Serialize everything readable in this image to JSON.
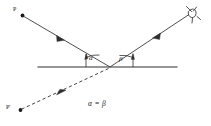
{
  "figure": {
    "type": "optics-reflection-diagram",
    "background_color": "#ffffff",
    "stroke_color": "#2a2a2a",
    "labels": {
      "source_point": "P",
      "virtual_image_point": "P'",
      "angle_of_incidence": "α",
      "angle_of_reflection": "β",
      "equation": "α = β"
    },
    "elements": {
      "mirror_line_name": "mirror-surface",
      "incident_ray_name": "incident-ray",
      "reflected_ray_name": "reflected-ray",
      "virtual_ray_name": "virtual-ray-dashed",
      "eye_name": "eye-symbol",
      "source_dot_name": "source-point-dot",
      "image_dot_name": "virtual-image-dot"
    },
    "geometry": {
      "mirror": {
        "x1": 38,
        "y1": 67,
        "x2": 177,
        "y2": 67
      },
      "incidence_point": {
        "x": 110,
        "y": 67
      },
      "source_dot": {
        "x": 22,
        "y": 15,
        "r": 1.9
      },
      "image_dot": {
        "x": 20,
        "y": 110,
        "r": 1.9
      },
      "incident_ray": {
        "x1": 23,
        "y1": 16,
        "x2": 110,
        "y2": 67
      },
      "reflected_ray": {
        "x1": 110,
        "y1": 67,
        "x2": 190,
        "y2": 14
      },
      "virtual_ray": {
        "x1": 108,
        "y1": 69,
        "x2": 21,
        "y2": 109
      },
      "eye": {
        "x": 193,
        "y": 13
      }
    }
  }
}
